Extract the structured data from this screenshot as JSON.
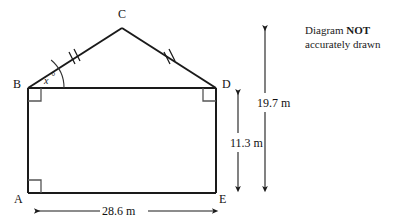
{
  "figure": {
    "type": "geometry-diagram",
    "shape": "pentagon-house",
    "background_color": "#ffffff",
    "stroke_color": "#1a1a1a",
    "vertices": [
      {
        "label": "A",
        "x": 28,
        "y": 193
      },
      {
        "label": "B",
        "x": 28,
        "y": 88
      },
      {
        "label": "C",
        "x": 122,
        "y": 28
      },
      {
        "label": "D",
        "x": 216,
        "y": 88
      },
      {
        "label": "E",
        "x": 216,
        "y": 193
      }
    ],
    "vertex_labels": {
      "A": "A",
      "B": "B",
      "C": "C",
      "D": "D",
      "E": "E"
    },
    "angle_label": "x",
    "angle_degree_symbol": "°",
    "right_angles": [
      {
        "at": "B",
        "corner_x": 28,
        "corner_y": 88
      },
      {
        "at": "D",
        "corner_x": 216,
        "corner_y": 88
      },
      {
        "at": "A",
        "corner_x": 28,
        "corner_y": 193
      }
    ],
    "congruent_marks": {
      "count": 2,
      "segments": [
        "BC",
        "CD"
      ]
    },
    "dimensions": [
      {
        "name": "height-right",
        "label": "11.3 m",
        "value": 11.3,
        "unit": "m",
        "orientation": "vertical",
        "from": "D",
        "to": "E"
      },
      {
        "name": "height-total",
        "label": "19.7 m",
        "value": 19.7,
        "unit": "m",
        "orientation": "vertical",
        "from": "apex-level",
        "to": "base-level"
      },
      {
        "name": "width-base",
        "label": "28.6 m",
        "value": 28.6,
        "unit": "m",
        "orientation": "horizontal",
        "from": "A",
        "to": "E"
      }
    ]
  },
  "note": {
    "line1_prefix": "Diagram ",
    "line1_bold": "NOT",
    "line2": "accurately drawn"
  }
}
